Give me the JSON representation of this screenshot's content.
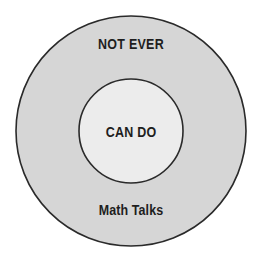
{
  "diagram": {
    "type": "concentric-circles",
    "colors": {
      "outer_fill": "#d6d6d6",
      "inner_fill": "#ececec",
      "stroke": "#2a2a2a",
      "text": "#1e1e1e"
    },
    "outer_circle": {
      "label": "NOT EVER",
      "cx": 131,
      "cy": 131,
      "r": 115
    },
    "inner_circle": {
      "label": "CAN DO",
      "cx": 131,
      "cy": 131,
      "r": 52
    },
    "caption": "Math Talks"
  }
}
